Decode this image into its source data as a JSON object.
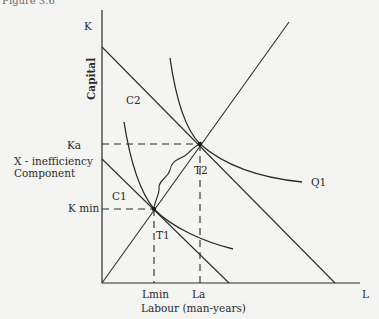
{
  "figure": {
    "caption_partial": "Figure 3.6",
    "y_axis": {
      "top_label": "K",
      "title": "Capital"
    },
    "x_axis": {
      "end_label": "L",
      "title": "Labour (man-years)"
    },
    "y_ticks": {
      "ka": "Ka",
      "kmin": "K min"
    },
    "x_ticks": {
      "lmin": "Lmin",
      "la": "La"
    },
    "bracket_label_line1": "X - inefficiency",
    "bracket_label_line2": "Component",
    "curve_labels": {
      "c1": "C1",
      "c2": "C2",
      "q1": "Q1"
    },
    "point_labels": {
      "t1": "T1",
      "t2": "T2"
    },
    "colors": {
      "ink": "#2a2a2a",
      "paper": "#f4f4f2"
    }
  }
}
